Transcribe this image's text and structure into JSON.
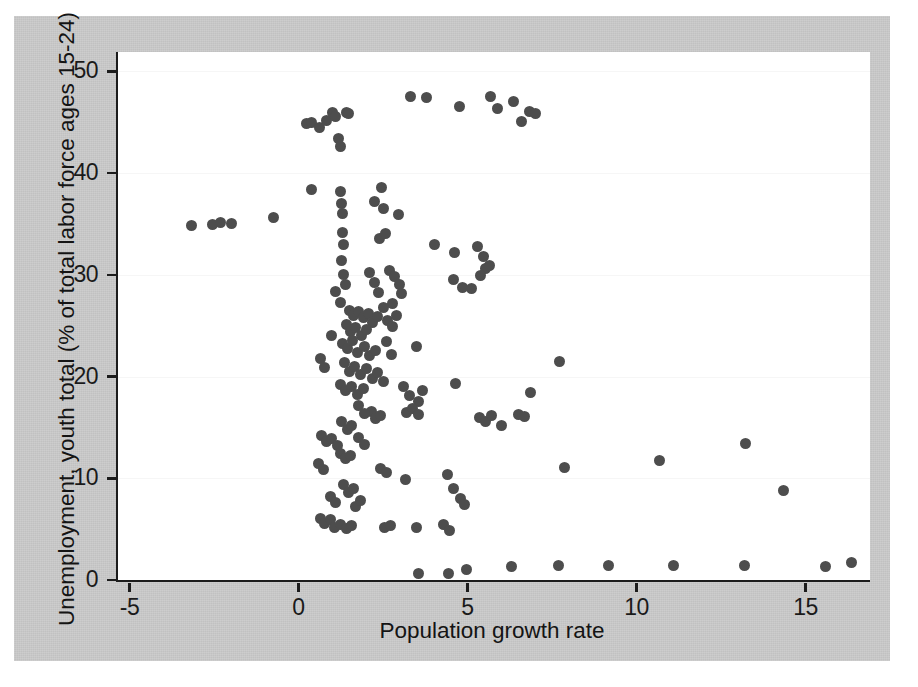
{
  "chart_data": {
    "type": "scatter",
    "title": "",
    "xlabel": "Population growth rate",
    "ylabel": "Unemployment, youth total (% of total labor force ages 15-24)",
    "xlim": [
      -5.4,
      16.85
    ],
    "ylim": [
      0,
      51.9
    ],
    "xticks": [
      -5,
      0,
      5,
      10,
      15
    ],
    "xticklabels": [
      "-5",
      "0",
      "5",
      "10",
      "15"
    ],
    "yticks": [
      0,
      10,
      20,
      30,
      40,
      50
    ],
    "yticklabels": [
      "0",
      "10",
      "20",
      "30",
      "40",
      "50"
    ],
    "grid": "horizontal-faint",
    "legend": null,
    "marker": {
      "shape": "circle",
      "color": "#4d4d4d",
      "size_px": 11
    },
    "background": {
      "figure": "#c9c9c9",
      "axes": "#ffffff",
      "page": "#ffffff"
    },
    "points": [
      [
        -3.22,
        34.8
      ],
      [
        -2.6,
        34.9
      ],
      [
        -2.38,
        35.1
      ],
      [
        -2.05,
        35.0
      ],
      [
        -0.8,
        35.6
      ],
      [
        0.18,
        44.9
      ],
      [
        0.32,
        45.0
      ],
      [
        0.55,
        44.5
      ],
      [
        0.78,
        45.2
      ],
      [
        0.95,
        46.0
      ],
      [
        1.05,
        45.6
      ],
      [
        1.12,
        43.4
      ],
      [
        1.18,
        42.6
      ],
      [
        1.35,
        46.0
      ],
      [
        1.42,
        45.9
      ],
      [
        3.25,
        47.5
      ],
      [
        3.72,
        47.4
      ],
      [
        4.7,
        46.5
      ],
      [
        5.62,
        47.5
      ],
      [
        5.82,
        46.3
      ],
      [
        6.3,
        47.0
      ],
      [
        6.55,
        45.1
      ],
      [
        6.78,
        46.1
      ],
      [
        6.95,
        45.9
      ],
      [
        0.32,
        38.4
      ],
      [
        1.18,
        38.2
      ],
      [
        1.22,
        37.0
      ],
      [
        1.25,
        36.0
      ],
      [
        2.4,
        38.6
      ],
      [
        2.18,
        37.2
      ],
      [
        2.45,
        36.5
      ],
      [
        2.9,
        35.9
      ],
      [
        1.25,
        34.2
      ],
      [
        1.28,
        33.0
      ],
      [
        2.35,
        33.6
      ],
      [
        2.52,
        34.1
      ],
      [
        3.95,
        33.0
      ],
      [
        4.55,
        32.2
      ],
      [
        5.25,
        32.8
      ],
      [
        5.42,
        31.8
      ],
      [
        5.48,
        30.6
      ],
      [
        4.52,
        29.5
      ],
      [
        4.8,
        28.8
      ],
      [
        5.05,
        28.7
      ],
      [
        5.32,
        29.9
      ],
      [
        5.58,
        30.9
      ],
      [
        1.22,
        31.4
      ],
      [
        1.28,
        30.0
      ],
      [
        1.32,
        29.0
      ],
      [
        1.05,
        28.4
      ],
      [
        1.18,
        27.3
      ],
      [
        2.05,
        30.2
      ],
      [
        2.2,
        29.2
      ],
      [
        2.3,
        28.3
      ],
      [
        2.62,
        30.4
      ],
      [
        2.78,
        29.8
      ],
      [
        2.92,
        29.0
      ],
      [
        3.0,
        28.2
      ],
      [
        2.72,
        27.2
      ],
      [
        1.45,
        26.5
      ],
      [
        1.58,
        26.0
      ],
      [
        1.72,
        26.4
      ],
      [
        1.85,
        25.8
      ],
      [
        2.0,
        26.2
      ],
      [
        2.12,
        25.3
      ],
      [
        2.28,
        25.9
      ],
      [
        1.35,
        25.1
      ],
      [
        1.48,
        24.4
      ],
      [
        1.62,
        24.8
      ],
      [
        1.8,
        24.0
      ],
      [
        1.95,
        24.6
      ],
      [
        2.45,
        26.8
      ],
      [
        2.58,
        25.5
      ],
      [
        2.72,
        24.9
      ],
      [
        2.85,
        26.0
      ],
      [
        0.92,
        24.0
      ],
      [
        1.25,
        23.2
      ],
      [
        1.4,
        22.8
      ],
      [
        1.55,
        23.5
      ],
      [
        1.7,
        22.4
      ],
      [
        1.88,
        23.0
      ],
      [
        2.05,
        22.1
      ],
      [
        2.22,
        22.6
      ],
      [
        2.55,
        23.4
      ],
      [
        2.68,
        22.2
      ],
      [
        3.42,
        23.0
      ],
      [
        0.58,
        21.8
      ],
      [
        0.72,
        20.9
      ],
      [
        1.3,
        21.4
      ],
      [
        1.45,
        20.5
      ],
      [
        1.6,
        21.0
      ],
      [
        1.78,
        20.2
      ],
      [
        1.95,
        20.8
      ],
      [
        2.12,
        19.8
      ],
      [
        2.28,
        20.4
      ],
      [
        2.45,
        19.5
      ],
      [
        1.18,
        19.2
      ],
      [
        1.32,
        18.6
      ],
      [
        1.5,
        19.0
      ],
      [
        1.68,
        18.2
      ],
      [
        1.85,
        18.8
      ],
      [
        3.05,
        19.0
      ],
      [
        3.22,
        18.1
      ],
      [
        3.48,
        17.5
      ],
      [
        3.62,
        18.6
      ],
      [
        4.6,
        19.3
      ],
      [
        7.65,
        21.5
      ],
      [
        6.8,
        18.4
      ],
      [
        3.15,
        16.5
      ],
      [
        3.3,
        16.9
      ],
      [
        3.48,
        16.3
      ],
      [
        2.1,
        16.6
      ],
      [
        2.22,
        15.9
      ],
      [
        2.38,
        16.2
      ],
      [
        1.72,
        17.2
      ],
      [
        1.88,
        16.4
      ],
      [
        5.3,
        16.0
      ],
      [
        5.48,
        15.6
      ],
      [
        5.65,
        16.2
      ],
      [
        6.45,
        16.3
      ],
      [
        6.62,
        16.1
      ],
      [
        5.95,
        15.2
      ],
      [
        1.22,
        15.6
      ],
      [
        1.38,
        14.8
      ],
      [
        1.52,
        15.2
      ],
      [
        0.62,
        14.2
      ],
      [
        0.78,
        13.6
      ],
      [
        0.92,
        13.9
      ],
      [
        1.08,
        13.2
      ],
      [
        1.72,
        14.0
      ],
      [
        1.88,
        13.3
      ],
      [
        1.18,
        12.4
      ],
      [
        1.32,
        11.9
      ],
      [
        1.48,
        12.2
      ],
      [
        0.52,
        11.5
      ],
      [
        0.68,
        10.9
      ],
      [
        2.38,
        11.0
      ],
      [
        2.55,
        10.6
      ],
      [
        3.12,
        9.9
      ],
      [
        4.35,
        10.4
      ],
      [
        4.52,
        9.0
      ],
      [
        7.82,
        11.1
      ],
      [
        10.62,
        11.7
      ],
      [
        13.18,
        13.4
      ],
      [
        14.3,
        8.8
      ],
      [
        1.28,
        9.4
      ],
      [
        1.42,
        8.6
      ],
      [
        1.58,
        9.0
      ],
      [
        0.88,
        8.2
      ],
      [
        1.05,
        7.6
      ],
      [
        1.62,
        7.2
      ],
      [
        1.78,
        7.8
      ],
      [
        4.72,
        8.0
      ],
      [
        4.85,
        7.4
      ],
      [
        0.58,
        6.0
      ],
      [
        0.72,
        5.6
      ],
      [
        0.88,
        5.9
      ],
      [
        1.02,
        5.2
      ],
      [
        1.18,
        5.5
      ],
      [
        1.35,
        5.1
      ],
      [
        1.52,
        5.4
      ],
      [
        2.48,
        5.2
      ],
      [
        2.65,
        5.4
      ],
      [
        3.42,
        5.2
      ],
      [
        4.22,
        5.5
      ],
      [
        4.4,
        4.9
      ],
      [
        3.48,
        0.6
      ],
      [
        4.38,
        0.6
      ],
      [
        4.9,
        1.0
      ],
      [
        6.25,
        1.3
      ],
      [
        7.62,
        1.4
      ],
      [
        9.12,
        1.4
      ],
      [
        11.05,
        1.4
      ],
      [
        13.15,
        1.4
      ],
      [
        15.52,
        1.3
      ],
      [
        16.3,
        1.7
      ]
    ]
  }
}
